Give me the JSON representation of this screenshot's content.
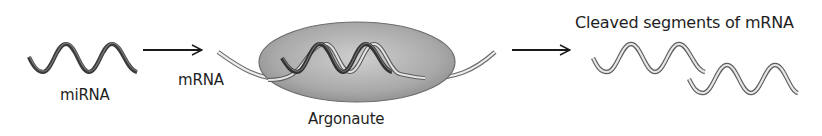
{
  "diagram": {
    "type": "process-flow",
    "colors": {
      "background": "#ffffff",
      "text": "#1e1e1e",
      "arrow": "#1a1a1a",
      "mirna_strand": "#4a4a4a",
      "mrna_strand_fill": "#e6e6e6",
      "mrna_strand_edge": "#6a6a6a",
      "argonaute_fill_center": "#c8c8c8",
      "argonaute_fill_edge": "#8f8f8f",
      "argonaute_edge": "#6a6a6a"
    },
    "nodes": [
      {
        "id": "mirna",
        "label": "miRNA",
        "shape": "dark helix strand"
      },
      {
        "id": "mrna",
        "label": "mRNA",
        "shape": "light ribbon strand"
      },
      {
        "id": "argonaute",
        "label": "Argonaute",
        "shape": "grey ellipse containing miRNA:mRNA duplex"
      },
      {
        "id": "cleaved",
        "label": "Cleaved segments of mRNA",
        "shape": "two light helix fragments"
      }
    ],
    "edges": [
      {
        "from": "mirna",
        "to": "argonaute",
        "style": "arrow"
      },
      {
        "from": "argonaute",
        "to": "cleaved",
        "style": "arrow"
      }
    ]
  },
  "labels": {
    "mirna": "miRNA",
    "mrna": "mRNA",
    "argonaute": "Argonaute",
    "cleaved": "Cleaved segments of mRNA"
  }
}
